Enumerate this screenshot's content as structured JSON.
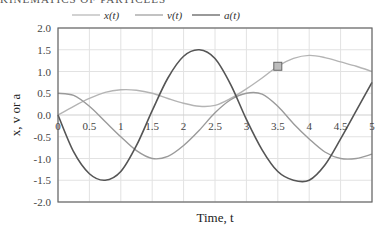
{
  "page": {
    "heading": "KINEMATICS OF PARTICLES"
  },
  "chart_data": {
    "type": "line",
    "title": "",
    "xlabel": "Time, t",
    "ylabel": "x, v or a",
    "xlim": [
      0,
      5
    ],
    "ylim": [
      -2.0,
      2.0
    ],
    "grid": true,
    "legend_position": "top",
    "x_ticks": [
      "0",
      "0.5",
      "1",
      "1.5",
      "2",
      "2.5",
      "3",
      "3.5",
      "4",
      "4.5",
      "5"
    ],
    "y_ticks": [
      "2.0",
      "1.5",
      "1.0",
      "0.5",
      "0.0",
      "-0.5",
      "-1.0",
      "-1.5",
      "-2.0"
    ],
    "x": [
      0,
      0.25,
      0.5,
      0.75,
      1,
      1.25,
      1.5,
      1.75,
      2,
      2.25,
      2.5,
      2.75,
      3,
      3.25,
      3.5,
      3.75,
      4,
      4.25,
      4.5,
      4.75,
      5
    ],
    "series": [
      {
        "name": "x(t)",
        "color": "#b4b4b4",
        "values": [
          0,
          0.2,
          0.38,
          0.52,
          0.58,
          0.57,
          0.5,
          0.38,
          0.27,
          0.2,
          0.22,
          0.38,
          0.6,
          0.85,
          1.12,
          1.3,
          1.37,
          1.32,
          1.22,
          1.12,
          1.0
        ]
      },
      {
        "name": "v(t)",
        "color": "#9a9a9a",
        "values": [
          0.5,
          0.45,
          0.2,
          -0.15,
          -0.5,
          -0.82,
          -1.0,
          -0.95,
          -0.7,
          -0.35,
          0.05,
          0.35,
          0.5,
          0.48,
          0.2,
          -0.2,
          -0.55,
          -0.85,
          -1.0,
          -1.0,
          -0.9
        ]
      },
      {
        "name": "a(t)",
        "color": "#555555",
        "values": [
          0,
          -0.85,
          -1.35,
          -1.5,
          -1.3,
          -0.7,
          0.1,
          0.85,
          1.35,
          1.5,
          1.3,
          0.7,
          -0.1,
          -0.8,
          -1.3,
          -1.5,
          -1.5,
          -1.15,
          -0.55,
          0.1,
          0.75
        ]
      }
    ],
    "annotations": [
      {
        "type": "square-marker",
        "x": 3.5,
        "y": 1.12,
        "series": "x(t)",
        "color": "#bdbdbd"
      }
    ]
  }
}
